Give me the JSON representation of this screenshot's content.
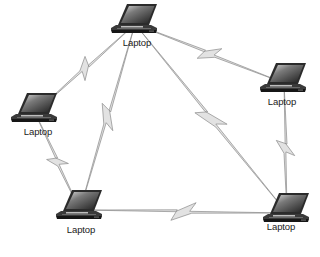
{
  "diagram": {
    "type": "wireless-mesh-network",
    "colors": {
      "link_fill": "#e2e2e2",
      "link_stroke": "#8a8a8a",
      "laptop_body": "#2b2b2b",
      "laptop_screen_light": "#d8d8d8",
      "laptop_screen_dark": "#1e1e1e",
      "label_text": "#1a1a1a"
    },
    "nodes": [
      {
        "id": "top",
        "label": "Laptop",
        "icon": "laptop-icon",
        "x": 135,
        "y": 24,
        "label_x": 137,
        "label_y": 45
      },
      {
        "id": "left",
        "label": "Laptop",
        "icon": "laptop-icon",
        "x": 35,
        "y": 113,
        "label_x": 38,
        "label_y": 134
      },
      {
        "id": "right",
        "label": "Laptop",
        "icon": "laptop-icon",
        "x": 284,
        "y": 83,
        "label_x": 282,
        "label_y": 104
      },
      {
        "id": "bottom-left",
        "label": "Laptop",
        "icon": "laptop-icon",
        "x": 80,
        "y": 210,
        "label_x": 81,
        "label_y": 232
      },
      {
        "id": "bottom-right",
        "label": "Laptop",
        "icon": "laptop-icon",
        "x": 287,
        "y": 213,
        "label_x": 281,
        "label_y": 229
      }
    ],
    "links": [
      {
        "from": "top",
        "to": "left",
        "kind": "wireless"
      },
      {
        "from": "top",
        "to": "right",
        "kind": "wireless"
      },
      {
        "from": "top",
        "to": "bottom-left",
        "kind": "wireless"
      },
      {
        "from": "top",
        "to": "bottom-right",
        "kind": "wireless"
      },
      {
        "from": "left",
        "to": "bottom-left",
        "kind": "wireless"
      },
      {
        "from": "right",
        "to": "bottom-right",
        "kind": "wireless"
      },
      {
        "from": "bottom-left",
        "to": "bottom-right",
        "kind": "wireless"
      }
    ]
  }
}
